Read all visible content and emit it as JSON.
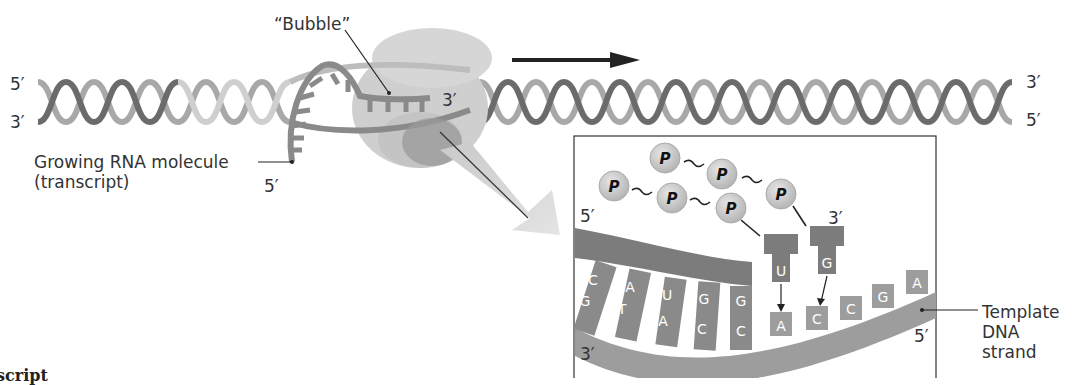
{
  "labels": {
    "bubble": "“Bubble”",
    "strand_left_top": "5′",
    "strand_left_bottom": "3′",
    "strand_right_top": "3′",
    "strand_right_bottom": "5′",
    "rna_3prime": "3′",
    "rna_5prime": "5′",
    "growing_rna_line1": "Growing RNA molecule",
    "growing_rna_line2": "(transcript)",
    "inset_5prime_top": "5′",
    "inset_3prime_top": "3′",
    "inset_3prime_bottom": "3′",
    "inset_5prime_bottom": "5′",
    "template_line1": "Template",
    "template_line2": "DNA",
    "template_line3": "strand",
    "cutoff_text": "script"
  },
  "nucleotides": {
    "phosphate_symbol": "P",
    "rna_bases": [
      "C",
      "A",
      "U",
      "G",
      "G"
    ],
    "dna_paired_bases": [
      "G",
      "T",
      "A",
      "C",
      "C"
    ],
    "incoming_rna_bases": [
      "U",
      "G"
    ],
    "dna_unpaired_bases": [
      "A",
      "C",
      "C",
      "G",
      "A"
    ]
  },
  "colors": {
    "dna_dark": "#6b6b6b",
    "dna_light": "#a8a8a8",
    "rna": "#8a8a8a",
    "polymerase": "#cfcfcf",
    "polymerase_dark": "#9a9a9a",
    "arrow": "#222222",
    "phosphate": "#c8c8c8",
    "template_strand": "#9d9d9d",
    "rna_inset": "#7c7c7c"
  }
}
